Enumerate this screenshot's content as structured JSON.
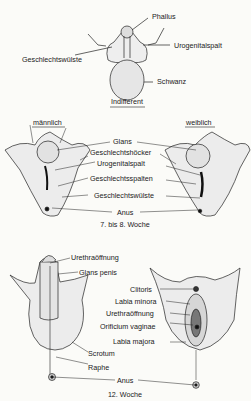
{
  "stages": {
    "indifferent": {
      "caption": "Indifferent",
      "labels": {
        "phallus": "Phallus",
        "urogenitalspalt": "Urogenitalspalt",
        "geschlechtswuelste": "Geschlechtswülste",
        "schwanz": "Schwanz"
      }
    },
    "week7_8": {
      "caption": "7. bis 8. Woche",
      "male_heading": "männlich",
      "female_heading": "weiblich",
      "labels": {
        "glans": "Glans",
        "geschlechtshoecker": "Geschlechtshöcker",
        "urogenitalspalt": "Urogenitalspalt",
        "geschlechtsspalten": "Geschlechtsspalten",
        "geschlechtswuelste": "Geschlechtswülste",
        "anus": "Anus"
      }
    },
    "week12": {
      "caption": "12. Woche",
      "male_labels": {
        "urethraoeffnung": "Urethraöffnung",
        "glans_penis": "Glans penis",
        "scrotum": "Scrotum",
        "raphe": "Raphe"
      },
      "female_labels": {
        "clitoris": "Clitoris",
        "labia_minora": "Labia minora",
        "urethraoeffnung": "Urethraöffnung",
        "orificium_vaginae": "Orificium vaginae",
        "labia_majora": "Labia majora"
      },
      "anus": "Anus"
    }
  }
}
